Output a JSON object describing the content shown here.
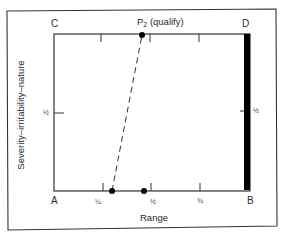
{
  "diagram": {
    "corners": {
      "top_left": "C",
      "top_right": "D",
      "bottom_left": "A",
      "bottom_right": "B"
    },
    "point_label": {
      "prefix": "P",
      "subscript": "2",
      "suffix": " (qualify)"
    },
    "x_axis": {
      "title": "Range",
      "ticks": [
        {
          "label": "¼",
          "value": 0.25
        },
        {
          "label": "½",
          "value": 0.5
        },
        {
          "label": "¾",
          "value": 0.75
        }
      ]
    },
    "y_axis": {
      "title": "Severity–irritability–nature",
      "ticks": [
        {
          "label": "½",
          "value": 0.5
        }
      ]
    },
    "right_axis": {
      "ticks": [
        {
          "label": "½",
          "value": 0.5
        }
      ]
    },
    "elements": {
      "dashed_line": {
        "from": {
          "x": 0.31,
          "y": 0.0
        },
        "to": {
          "x": 0.47,
          "y": 1.0
        },
        "style": "dashed"
      },
      "points": [
        {
          "name": "P2",
          "x": 0.47,
          "y": 1.0
        },
        {
          "name": "bottom-start",
          "x": 0.31,
          "y": 0.0
        },
        {
          "name": "bottom-mid",
          "x": 0.46,
          "y": 0.0
        }
      ],
      "black_bar": {
        "x": 1.0,
        "y_from": 0.0,
        "y_to": 1.0,
        "color": "#000000"
      }
    }
  }
}
